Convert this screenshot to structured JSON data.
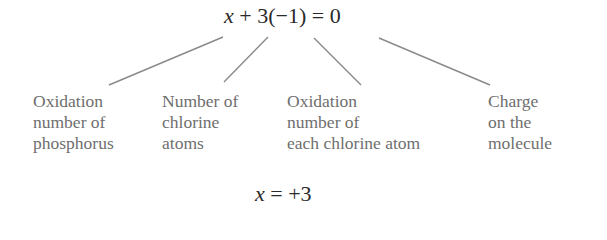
{
  "equation": {
    "variable": "x",
    "rest": " + 3(−1) = 0"
  },
  "labels": [
    {
      "lines": [
        "Oxidation",
        "number of",
        "phosphorus"
      ]
    },
    {
      "lines": [
        "Number of",
        "chlorine",
        "atoms"
      ]
    },
    {
      "lines": [
        "Oxidation",
        "number of",
        "each chlorine atom"
      ]
    },
    {
      "lines": [
        "Charge",
        "on the",
        "molecule"
      ]
    }
  ],
  "result": {
    "variable": "x",
    "rest": " = +3"
  },
  "colors": {
    "equation_text": "#2a2a2a",
    "label_text": "#6e6e6e",
    "connector_line": "#8a8a8a"
  }
}
